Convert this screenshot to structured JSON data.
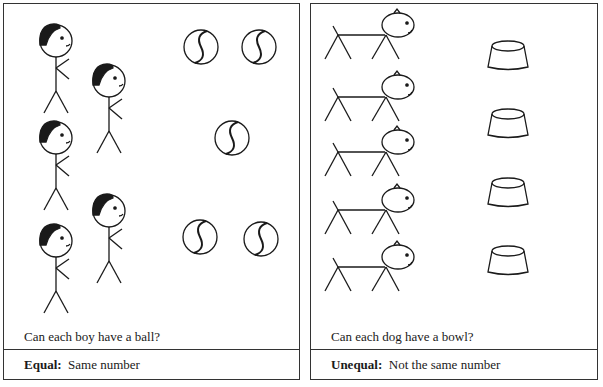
{
  "left_panel": {
    "question": "Can each boy have a ball?",
    "caption_bold": "Equal:",
    "caption_text": "Same number",
    "boys": [
      {
        "x": 55,
        "y": 40
      },
      {
        "x": 108,
        "y": 80
      },
      {
        "x": 55,
        "y": 137
      },
      {
        "x": 108,
        "y": 210
      },
      {
        "x": 55,
        "y": 240
      }
    ],
    "balls": [
      {
        "x": 200,
        "y": 46
      },
      {
        "x": 258,
        "y": 46
      },
      {
        "x": 231,
        "y": 137
      },
      {
        "x": 199,
        "y": 236
      },
      {
        "x": 260,
        "y": 238
      }
    ],
    "boy_count": 5,
    "ball_count": 5
  },
  "right_panel": {
    "question": "Can each dog have a bowl?",
    "caption_bold": "Unequal:",
    "caption_text": "Not the same number",
    "dogs": [
      {
        "x": 0,
        "y": 0
      },
      {
        "x": 0,
        "y": 62
      },
      {
        "x": 0,
        "y": 117
      },
      {
        "x": 0,
        "y": 175
      },
      {
        "x": 0,
        "y": 232
      }
    ],
    "bowls": [
      {
        "x": 0,
        "y": 0
      },
      {
        "x": 0,
        "y": 68
      },
      {
        "x": 0,
        "y": 137
      },
      {
        "x": 0,
        "y": 205
      }
    ],
    "dog_count": 5,
    "bowl_count": 4
  }
}
